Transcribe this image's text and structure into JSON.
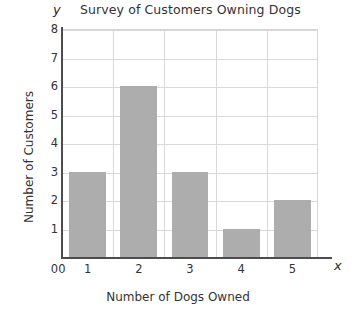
{
  "chart_data": {
    "type": "bar",
    "title": "Survey of Customers Owning Dogs",
    "xlabel": "Number of Dogs Owned",
    "ylabel": "Number of Customers",
    "categories": [
      "1",
      "2",
      "3",
      "4",
      "5"
    ],
    "values": [
      3,
      6,
      3,
      1,
      2
    ],
    "xlim": [
      0,
      5
    ],
    "ylim": [
      0,
      8
    ],
    "x_ticks": [
      "0",
      "1",
      "2",
      "3",
      "4",
      "5"
    ],
    "y_ticks": [
      "0",
      "1",
      "2",
      "3",
      "4",
      "5",
      "6",
      "7",
      "8"
    ],
    "y_tick_values": [
      0,
      1,
      2,
      3,
      4,
      5,
      6,
      7,
      8
    ],
    "grid": true,
    "legend": "none",
    "bar_color": "#adadad",
    "grid_color": "#d9d9d9",
    "axis_color": "#4d4d4d",
    "background": "#ffffff",
    "axis_letter_y": "y",
    "axis_letter_x": "x"
  }
}
